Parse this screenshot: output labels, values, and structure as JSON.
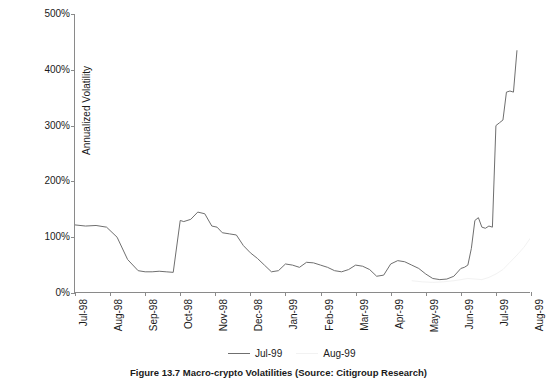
{
  "chart_data": {
    "type": "line",
    "title": "",
    "xlabel": "",
    "ylabel": "Annualized Volatility",
    "ylim": [
      0,
      500
    ],
    "ytick_labels": [
      "0%",
      "100%",
      "200%",
      "300%",
      "400%",
      "500%"
    ],
    "ytick_values": [
      0,
      100,
      200,
      300,
      400,
      500
    ],
    "xtick_labels": [
      "Jul-98",
      "Aug-98",
      "Sep-98",
      "Oct-98",
      "Nov-98",
      "Dec-98",
      "Jan-99",
      "Feb-99",
      "Mar-99",
      "Apr-99",
      "May-99",
      "Jun-99",
      "Jul-99",
      "Aug-99"
    ],
    "grid": false,
    "legend_position": "bottom",
    "series": [
      {
        "name": "Jul-99",
        "color": "#6f6f6f",
        "x": [
          0.0,
          0.3,
          0.6,
          0.9,
          1.2,
          1.5,
          1.8,
          2.0,
          2.2,
          2.4,
          2.6,
          2.8,
          3.0,
          3.1,
          3.3,
          3.5,
          3.7,
          3.9,
          4.05,
          4.2,
          4.4,
          4.6,
          4.8,
          5.0,
          5.2,
          5.4,
          5.6,
          5.8,
          6.0,
          6.2,
          6.4,
          6.6,
          6.8,
          7.0,
          7.2,
          7.4,
          7.6,
          7.8,
          8.0,
          8.2,
          8.4,
          8.6,
          8.8,
          9.0,
          9.2,
          9.4,
          9.6,
          9.8,
          10.0,
          10.2,
          10.4,
          10.6,
          10.8,
          11.0,
          11.1,
          11.2,
          11.3,
          11.4,
          11.5,
          11.6,
          11.7,
          11.8,
          11.9,
          12.0,
          12.1,
          12.2,
          12.3,
          12.4,
          12.5,
          12.6
        ],
        "values": [
          122,
          120,
          121,
          118,
          100,
          60,
          40,
          38,
          38,
          39,
          38,
          37,
          130,
          128,
          132,
          145,
          142,
          120,
          118,
          108,
          106,
          104,
          85,
          72,
          62,
          50,
          38,
          40,
          52,
          50,
          46,
          55,
          54,
          50,
          46,
          40,
          38,
          42,
          50,
          48,
          42,
          30,
          32,
          52,
          58,
          56,
          50,
          44,
          34,
          26,
          24,
          25,
          30,
          44,
          46,
          50,
          80,
          130,
          135,
          118,
          116,
          120,
          118,
          300,
          305,
          310,
          360,
          362,
          360,
          435
        ]
      },
      {
        "name": "Aug-99",
        "color": "#f2f2f2",
        "x": [
          9.6,
          9.9,
          10.2,
          10.5,
          10.8,
          11.0,
          11.2,
          11.4,
          11.6,
          11.8,
          12.0,
          12.2,
          12.4,
          12.6,
          12.8,
          13.0
        ],
        "values": [
          22,
          20,
          19,
          20,
          22,
          24,
          26,
          25,
          24,
          28,
          34,
          42,
          55,
          68,
          82,
          100
        ]
      }
    ]
  },
  "legend": {
    "items": [
      {
        "label": "Jul-99"
      },
      {
        "label": "Aug-99"
      }
    ]
  },
  "caption": {
    "text": "Figure 13.7   Macro-crypto Volatilities  (Source: Citigroup Research)"
  }
}
